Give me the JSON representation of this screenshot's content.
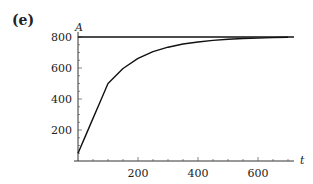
{
  "panel_label": "(e)",
  "chart_data": {
    "type": "line",
    "title": "",
    "xlabel": "t",
    "ylabel": "A",
    "xlim": [
      0,
      720
    ],
    "ylim": [
      0,
      820
    ],
    "x_ticks": [
      200,
      400,
      600
    ],
    "y_ticks": [
      200,
      400,
      600,
      800
    ],
    "grid": false,
    "legend": null,
    "series": [
      {
        "name": "A(t)",
        "x": [
          0,
          25,
          50,
          75,
          100,
          150,
          200,
          250,
          300,
          350,
          400,
          450,
          500,
          550,
          600,
          650,
          700
        ],
        "values": [
          50,
          162,
          275,
          387,
          500,
          597,
          662,
          705,
          734,
          755,
          768,
          778,
          785,
          790,
          793,
          796,
          798
        ]
      },
      {
        "name": "asymptote",
        "x": [
          0,
          720
        ],
        "values": [
          800,
          800
        ]
      }
    ]
  }
}
